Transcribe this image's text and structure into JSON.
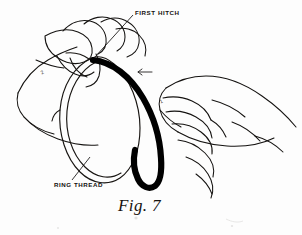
{
  "figure": {
    "caption": "Fig. 7",
    "background_color": "#fdfdfd",
    "ink_color": "#13110f",
    "cord_color": "#000000",
    "width": 302,
    "height": 235
  },
  "labels": {
    "first_hitch": "FIRST HITCH",
    "ring_thread": "RING THREAD",
    "micro_left": "2",
    "micro_right": "1"
  },
  "annotations": {
    "leader_first_hitch": "leader-line-first-hitch",
    "leader_ring_thread": "leader-line-ring-thread",
    "direction_arrow": "left-pointing-arrow"
  }
}
